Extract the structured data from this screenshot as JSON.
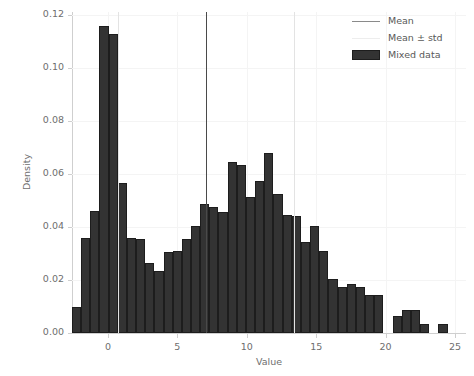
{
  "chart_data": {
    "type": "bar",
    "subtype": "histogram",
    "title": "",
    "xlabel": "Value",
    "ylabel": "Density",
    "xlim": [
      -3.0,
      25.4
    ],
    "ylim": [
      0.0,
      0.125
    ],
    "xticks": [
      0,
      5,
      10,
      15,
      20,
      25
    ],
    "xtick_labels": [
      "0",
      "5",
      "10",
      "15",
      "20",
      "25"
    ],
    "yticks": [
      0.0,
      0.02,
      0.04,
      0.06,
      0.08,
      0.1,
      0.12
    ],
    "ytick_labels": [
      "0.00",
      "0.02",
      "0.04",
      "0.06",
      "0.08",
      "0.10",
      "0.12"
    ],
    "grid": true,
    "legend_position": "upper right",
    "bin_width": 0.66,
    "bin_left_edges": [
      -2.6,
      -1.94,
      -1.28,
      -0.62,
      0.04,
      0.7,
      1.36,
      2.02,
      2.68,
      3.34,
      4.0,
      4.66,
      5.32,
      5.98,
      6.64,
      7.3,
      7.96,
      8.62,
      9.28,
      9.94,
      10.6,
      11.26,
      11.92,
      12.58,
      13.24,
      13.9,
      14.56,
      15.22,
      15.88,
      16.54,
      17.2,
      17.86,
      18.52,
      19.18,
      19.84,
      20.5,
      21.16,
      21.82,
      22.48,
      23.14,
      23.8
    ],
    "values": [
      0.01,
      0.036,
      0.046,
      0.116,
      0.113,
      0.0565,
      0.036,
      0.0355,
      0.0265,
      0.0235,
      0.0305,
      0.031,
      0.0355,
      0.0405,
      0.0485,
      0.0475,
      0.0455,
      0.0645,
      0.0635,
      0.0515,
      0.0575,
      0.068,
      0.0525,
      0.0445,
      0.044,
      0.0345,
      0.0405,
      0.031,
      0.0205,
      0.0175,
      0.0185,
      0.0175,
      0.0145,
      0.0145,
      0.0,
      0.0065,
      0.0085,
      0.0085,
      0.0035,
      0.0,
      0.0035
    ],
    "vlines": [
      {
        "name": "mean",
        "x": 7.05,
        "style": "solid",
        "color": "#4a4a4a"
      },
      {
        "name": "mean_minus_std",
        "x": 0.75,
        "style": "solid",
        "color": "#e3e3e3"
      },
      {
        "name": "mean_plus_std",
        "x": 13.4,
        "style": "solid",
        "color": "#e3e3e3"
      }
    ],
    "legend": [
      {
        "label": "Mean",
        "glyph": "line",
        "color": "#8a8a8a"
      },
      {
        "label": "Mean ± std",
        "glyph": "line",
        "color": "#ededed"
      },
      {
        "label": "Mixed data",
        "glyph": "patch",
        "color": "#333333"
      }
    ],
    "colors": {
      "bar_face": "#333333",
      "bar_edge": "#1d1d1d",
      "grid": "#f4f4f4",
      "axis": "#cfcfcf",
      "text": "#6e6e6e",
      "background": "#ffffff"
    }
  }
}
